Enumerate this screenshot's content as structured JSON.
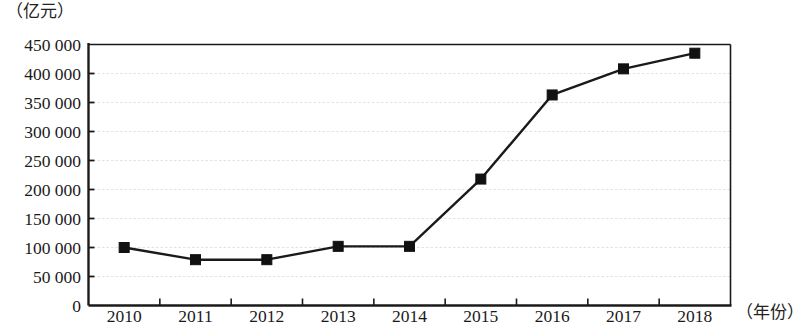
{
  "chart_data": {
    "type": "line",
    "title": "",
    "ylabel": "（亿元）",
    "xlabel": "（年份）",
    "categories": [
      "2010",
      "2011",
      "2012",
      "2013",
      "2014",
      "2015",
      "2016",
      "2017",
      "2018"
    ],
    "values": [
      100000,
      79000,
      79000,
      102000,
      102000,
      218000,
      363000,
      408000,
      435000
    ],
    "series": [
      {
        "name": "",
        "values": [
          100000,
          79000,
          79000,
          102000,
          102000,
          218000,
          363000,
          408000,
          435000
        ]
      }
    ],
    "ylim": [
      0,
      450000
    ],
    "ytick_labels": [
      "0",
      "50 000",
      "100 000",
      "150 000",
      "200 000",
      "250 000",
      "300 000",
      "350 000",
      "400 000",
      "450 000"
    ],
    "ytick_values": [
      0,
      50000,
      100000,
      150000,
      200000,
      250000,
      300000,
      350000,
      400000,
      450000
    ],
    "grid": true,
    "grid_axis": "y",
    "grid_style": "dotted",
    "legend": "none",
    "marker": "square",
    "line_color": "#1a1a1a",
    "marker_color": "#111111",
    "grid_color": "#e2e2e2",
    "axis_color": "#1a1a1a",
    "background_color": "#ffffff"
  }
}
